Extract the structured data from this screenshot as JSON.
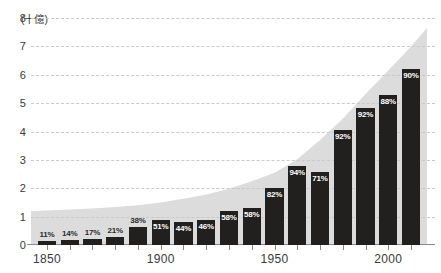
{
  "chart_data": {
    "type": "bar",
    "title": "",
    "subtitle": "",
    "xlabel": "",
    "ylabel": "",
    "y_unit_label": "(十億)",
    "ylim": [
      0,
      8
    ],
    "xlim": [
      1843,
      2017
    ],
    "grid": true,
    "legend": null,
    "y_ticks": [
      "0",
      "1",
      "2",
      "3",
      "4",
      "5",
      "6",
      "7",
      "8"
    ],
    "y_tick_values": [
      0,
      1,
      2,
      3,
      4,
      5,
      6,
      7,
      8
    ],
    "x_ticks": [
      "1850",
      "1900",
      "1950",
      "2000"
    ],
    "x_tick_values": [
      1850,
      1900,
      1950,
      2000
    ],
    "categories": [
      1850,
      1860,
      1870,
      1880,
      1890,
      1900,
      1910,
      1920,
      1930,
      1940,
      1950,
      1960,
      1970,
      1980,
      1990,
      2000,
      2010
    ],
    "values": [
      0.13,
      0.17,
      0.22,
      0.28,
      0.62,
      0.87,
      0.8,
      0.88,
      1.2,
      1.32,
      2.02,
      2.8,
      2.57,
      4.05,
      4.82,
      5.3,
      6.2
    ],
    "data_labels": [
      "11%",
      "14%",
      "17%",
      "21%",
      "38%",
      "51%",
      "44%",
      "46%",
      "58%",
      "58%",
      "82%",
      "94%",
      "71%",
      "92%",
      "92%",
      "88%",
      "90%"
    ],
    "label_placement": [
      "outside",
      "outside",
      "outside",
      "outside",
      "outside",
      "inside",
      "inside",
      "inside",
      "inside",
      "inside",
      "inside",
      "inside",
      "inside",
      "inside",
      "inside",
      "inside",
      "inside"
    ],
    "series": [
      {
        "name": "bars",
        "values": [
          0.13,
          0.17,
          0.22,
          0.28,
          0.62,
          0.87,
          0.8,
          0.88,
          1.2,
          1.32,
          2.02,
          2.8,
          2.57,
          4.05,
          4.82,
          5.3,
          6.2
        ],
        "color": "#221f1f"
      },
      {
        "name": "area",
        "x": [
          1843,
          1850,
          1860,
          1870,
          1880,
          1890,
          1900,
          1910,
          1920,
          1930,
          1940,
          1950,
          1960,
          1970,
          1980,
          1990,
          2000,
          2010,
          2017
        ],
        "values": [
          1.2,
          1.22,
          1.25,
          1.29,
          1.34,
          1.4,
          1.5,
          1.63,
          1.78,
          1.98,
          2.25,
          2.55,
          3.02,
          3.7,
          4.45,
          5.32,
          6.15,
          7.0,
          7.65
        ],
        "color": "#dcdcdc"
      }
    ],
    "colors": {
      "bar": "#221f1f",
      "area": "#dcdcdc",
      "grid": "#c9c9c9",
      "axis": "#8a8a8a",
      "text": "#3a3a3a",
      "label_inside": "#ffffff",
      "label_outside": "#2b2b2b",
      "background": "#ffffff"
    }
  }
}
